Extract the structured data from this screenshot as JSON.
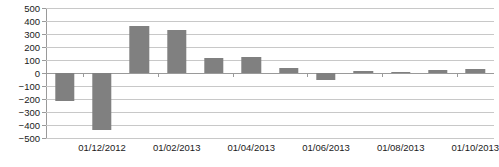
{
  "chart_data": {
    "type": "bar",
    "title": "",
    "subtitle": "",
    "xlabel": "",
    "ylabel": "",
    "grid": true,
    "legend": false,
    "bar_color": "#808080",
    "gridline_color": "#c8c8c8",
    "axis_color": "#9a9a9a",
    "ylim": [
      -500,
      500
    ],
    "ytick_step": 100,
    "yticks": [
      500,
      400,
      300,
      200,
      100,
      0,
      -100,
      -200,
      -300,
      -400,
      -500
    ],
    "ytick_labels": [
      "500",
      "400",
      "300",
      "200",
      "100",
      "0",
      "−100",
      "−200",
      "−300",
      "−400",
      "−500"
    ],
    "categories": [
      "01/11/2012",
      "01/12/2012",
      "01/01/2013",
      "01/02/2013",
      "01/03/2013",
      "01/04/2013",
      "01/05/2013",
      "01/06/2013",
      "01/07/2013",
      "01/08/2013",
      "01/09/2013",
      "01/10/2013"
    ],
    "values": [
      -215,
      -435,
      365,
      330,
      115,
      120,
      35,
      -55,
      15,
      5,
      20,
      30
    ],
    "xtick_labels": [
      "01/12/2012",
      "01/02/2013",
      "01/04/2013",
      "01/06/2013",
      "01/08/2013",
      "01/10/2013"
    ],
    "xtick_label_indices": [
      1,
      3,
      5,
      7,
      9,
      11
    ]
  }
}
